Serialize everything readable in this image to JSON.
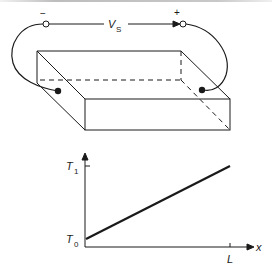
{
  "figure": {
    "circuit": {
      "source_label": "V",
      "source_subscript": "S",
      "negative_terminal": "−",
      "positive_terminal": "+"
    },
    "graph": {
      "y_tick_top": "T",
      "y_tick_top_sub": "1",
      "y_tick_bottom": "T",
      "y_tick_bottom_sub": "0",
      "x_tick": "L",
      "x_axis_label": "x"
    },
    "colors": {
      "ink": "#1a1a1a",
      "background": "#ffffff"
    }
  }
}
